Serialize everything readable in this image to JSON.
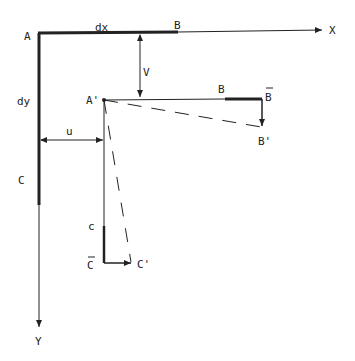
{
  "diagram": {
    "title": "",
    "labels": {
      "A": "A",
      "dx": "dx",
      "B_top": "B",
      "X": "X",
      "V": "V",
      "dy": "dy",
      "A_prime": "A'",
      "B_mid": "B",
      "B_bar": "B",
      "B_prime": "B'",
      "u": "u",
      "C": "C",
      "c_small": "c",
      "C_bar": "C",
      "C_prime": "C'",
      "Y": "Y"
    },
    "colors": {
      "line": "#222222",
      "background": "#ffffff"
    }
  }
}
